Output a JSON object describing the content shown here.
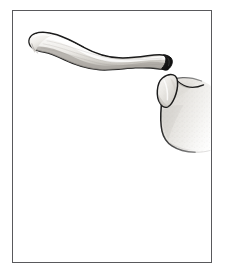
{
  "figure": {
    "title": "Clavicle and scapula, superior view",
    "caption": "",
    "background_color": "#ffffff",
    "frame": {
      "border_color": "#59595c",
      "border_width_px": 1,
      "inset_left_px": 12,
      "inset_top_px": 10,
      "width_px": 200,
      "height_px": 253,
      "fill": "#ffffff"
    }
  },
  "palette": {
    "outline": "#1b1b1b",
    "bone_light": "#f4f3f1",
    "bone_mid": "#dedcd8",
    "bone_shadow": "#b9b6b1",
    "bone_deep_shadow": "#8e8a85",
    "cut_surface_dark": "#141414",
    "stipple": "#9c9892",
    "frame_line": "#59595c"
  },
  "structures": [
    {
      "id": "clavicle",
      "label": "Clavicle",
      "description": "S-shaped long bone spanning from upper-left to mid-right, sternal end at left, acromial end at right",
      "fill": "#f0efec",
      "outline": "#1b1b1b"
    },
    {
      "id": "clavicle-sternal-end",
      "label": "Sternal (medial) end of clavicle",
      "description": "Rounded blunt expansion at the far left of the clavicle",
      "fill": "#e6e4e0",
      "outline": "#1b1b1b"
    },
    {
      "id": "clavicle-acromial-end",
      "label": "Acromial (lateral) end of clavicle",
      "description": "Dark wedge-shaped cut surface at the right tip of the clavicle",
      "fill": "#141414",
      "outline": "#0d0d0d"
    },
    {
      "id": "acromion",
      "label": "Acromion process",
      "description": "Tongue-shaped projection below and right of the clavicle tip",
      "fill": "#e9e7e3",
      "outline": "#1b1b1b"
    },
    {
      "id": "scapula-body",
      "label": "Scapula body",
      "description": "Large stippled mass at right, fading toward the lower right margin",
      "fill": "#dedcd8",
      "outline": "#1b1b1b"
    },
    {
      "id": "suprascapular-notch",
      "label": "Suprascapular notch region",
      "description": "Concave superior border between acromion and scapula body",
      "fill": "#e4e2de",
      "outline": "#1b1b1b"
    }
  ],
  "labels": [],
  "annotations": []
}
